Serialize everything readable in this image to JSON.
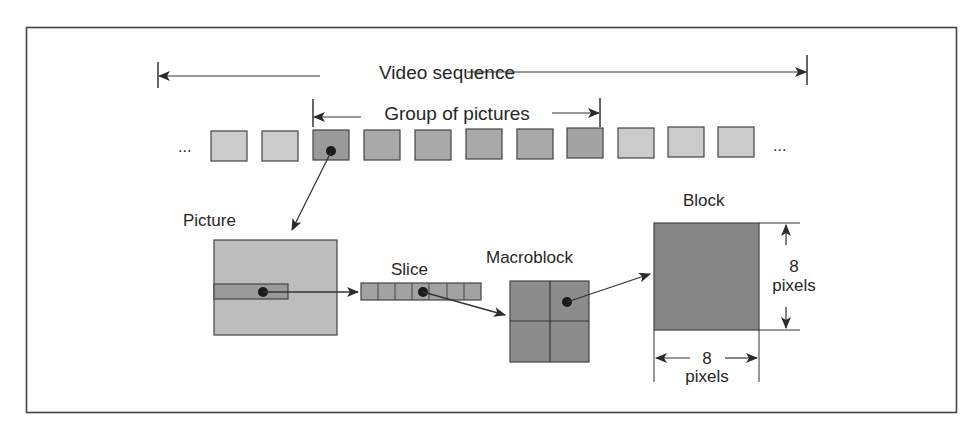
{
  "labels": {
    "video_sequence": "Video sequence",
    "group_of_pictures": "Group of pictures",
    "picture": "Picture",
    "slice": "Slice",
    "macroblock": "Macroblock",
    "block": "Block",
    "block_height_value": "8",
    "block_height_unit": "pixels",
    "block_width_value": "8",
    "block_width_unit": "pixels",
    "ellipsis_left": "...",
    "ellipsis_right": "..."
  },
  "sequence": {
    "frame_count": 11,
    "gop_frames": [
      2,
      3,
      4,
      5,
      6,
      7
    ],
    "selected_frame": 2
  },
  "slice": {
    "cells": 7,
    "selected_cell": 3
  },
  "macroblock": {
    "grid": "2x2",
    "selected_quadrant": "top-right"
  },
  "colors": {
    "frame_light": "#c9c9c9",
    "frame_dark": "#9d9d9d",
    "picture_fill": "#bdbdbd",
    "slice_fill": "#9a9a9a",
    "macroblock_fill": "#8a8a8a",
    "block_fill": "#858585",
    "stroke": "#333333"
  }
}
